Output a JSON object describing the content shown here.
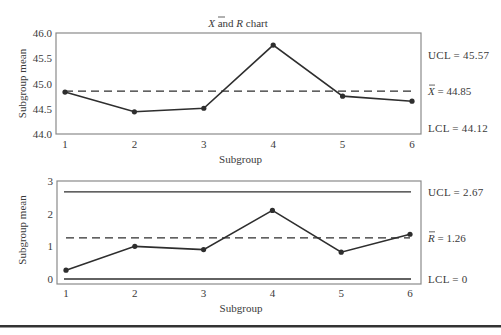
{
  "chart_data": [
    {
      "type": "line",
      "title": "X̄ and R chart",
      "title_parts": {
        "symbol": "X",
        "rest": " and ",
        "symbol2": "R",
        "suffix": " chart"
      },
      "xlabel": "Subgroup",
      "ylabel": "Subgroup mean",
      "categories": [
        "1",
        "2",
        "3",
        "4",
        "5",
        "6"
      ],
      "x": [
        1,
        2,
        3,
        4,
        5,
        6
      ],
      "values": [
        44.83,
        44.44,
        44.51,
        45.76,
        44.75,
        44.65
      ],
      "ylim": [
        44.0,
        46.0
      ],
      "yticks": [
        "44.0",
        "44.5",
        "45.0",
        "45.5",
        "46.0"
      ],
      "ytick_values": [
        44.0,
        44.5,
        45.0,
        45.5,
        46.0
      ],
      "control_lines": {
        "ucl": {
          "value": 45.57,
          "label": "UCL = 45.57",
          "style": "hidden"
        },
        "center": {
          "value": 44.85,
          "label_symbol": "X",
          "label_value": " = 44.85",
          "style": "dashed"
        },
        "lcl": {
          "value": 44.12,
          "label": "LCL = 44.12",
          "style": "hidden"
        }
      },
      "grid": false
    },
    {
      "type": "line",
      "title": "",
      "xlabel": "Subgroup",
      "ylabel": "Subgroup mean",
      "categories": [
        "1",
        "2",
        "3",
        "4",
        "5",
        "6"
      ],
      "x": [
        1,
        2,
        3,
        4,
        5,
        6
      ],
      "values": [
        0.27,
        1.0,
        0.9,
        2.1,
        0.82,
        1.37
      ],
      "ylim": [
        0,
        3
      ],
      "yticks": [
        "0",
        "1",
        "2",
        "3"
      ],
      "ytick_values": [
        0,
        1,
        2,
        3
      ],
      "control_lines": {
        "ucl": {
          "value": 2.67,
          "label": "UCL = 2.67",
          "style": "solid"
        },
        "center": {
          "value": 1.26,
          "label_symbol": "R",
          "label_value": " = 1.26",
          "style": "dashed"
        },
        "lcl": {
          "value": 0,
          "label": "LCL = 0",
          "style": "solid"
        }
      },
      "grid": false
    }
  ],
  "colors": {
    "line": "#2e2e2e",
    "frame": "#8a8a8a",
    "text": "#3a3a3a",
    "separator": "#333333"
  }
}
